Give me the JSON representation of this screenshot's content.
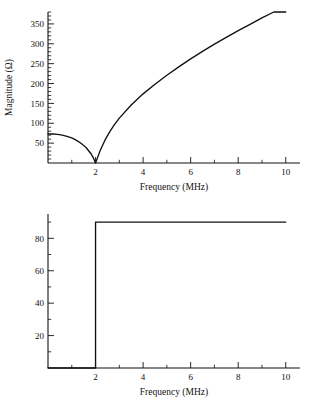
{
  "figure": {
    "title": "",
    "background_color": "#ffffff",
    "line_color": "#111111"
  },
  "chart_data": [
    {
      "type": "line",
      "name": "magnitude-plot",
      "title": "",
      "xlabel": "Frequency (MHz)",
      "ylabel": "Magnitude (Ω)",
      "xlim": [
        0,
        10.6
      ],
      "ylim": [
        0,
        380
      ],
      "xticks": [
        2,
        4,
        6,
        8,
        10
      ],
      "xticklabels": [
        "2",
        "4",
        "6",
        "8",
        "10"
      ],
      "xminor_step": 1,
      "yticks": [
        50,
        100,
        150,
        200,
        250,
        300,
        350
      ],
      "yticklabels": [
        "50",
        "100",
        "150",
        "200",
        "250",
        "300",
        "350"
      ],
      "yminor_step": 10,
      "grid": false,
      "legend": "none",
      "x": [
        0.0,
        0.2,
        0.4,
        0.6,
        0.8,
        1.0,
        1.2,
        1.4,
        1.6,
        1.8,
        1.9,
        1.95,
        2.0,
        2.05,
        2.1,
        2.2,
        2.4,
        2.6,
        2.8,
        3.0,
        3.5,
        4.0,
        4.5,
        5.0,
        5.5,
        6.0,
        6.5,
        7.0,
        7.5,
        8.0,
        8.5,
        9.0,
        9.5,
        10.0
      ],
      "y": [
        73,
        73,
        72,
        70,
        67,
        63,
        57,
        49,
        39,
        24,
        14,
        7,
        0,
        8,
        16,
        32,
        58,
        79,
        97,
        113,
        146,
        174,
        198,
        221,
        242,
        262,
        281,
        299,
        316,
        333,
        349,
        365,
        380,
        395
      ]
    },
    {
      "type": "line",
      "name": "phase-plot",
      "title": "",
      "xlabel": "Frequency (MHz)",
      "ylabel": "",
      "xlim": [
        0,
        10.6
      ],
      "ylim": [
        0,
        95
      ],
      "xticks": [
        2,
        4,
        6,
        8,
        10
      ],
      "xticklabels": [
        "2",
        "4",
        "6",
        "8",
        "10"
      ],
      "xminor_step": 1,
      "yticks": [
        20,
        40,
        60,
        80
      ],
      "yticklabels": [
        "20",
        "40",
        "60",
        "80"
      ],
      "yminor_step": 10,
      "grid": false,
      "legend": "none",
      "x": [
        0.0,
        2.0,
        2.0,
        10.0
      ],
      "y": [
        0,
        0,
        90,
        90
      ],
      "step_frequency": 2.0,
      "low_value": 0,
      "high_value": 90
    }
  ]
}
